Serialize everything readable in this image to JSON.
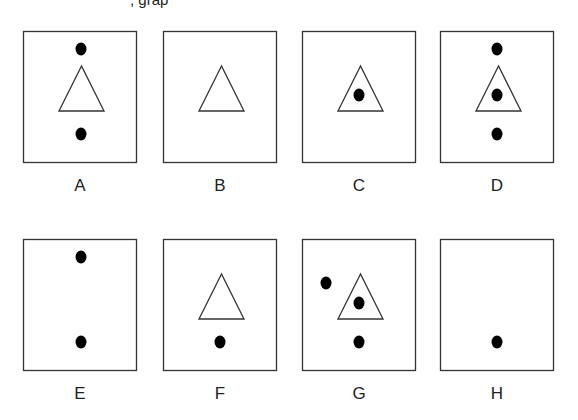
{
  "header": {
    "cut_off_text": ", grap"
  },
  "figure": {
    "stroke_color": "#333333",
    "fill_color": "#000000",
    "box": {
      "width": 113,
      "height": 131
    },
    "panels": [
      {
        "label": "A",
        "x": 23,
        "y": 31,
        "triangle": true,
        "dots": [
          {
            "x": 58,
            "y": 18
          },
          {
            "x": 58,
            "y": 103
          }
        ]
      },
      {
        "label": "B",
        "x": 163,
        "y": 31,
        "triangle": true,
        "dots": []
      },
      {
        "label": "C",
        "x": 302,
        "y": 31,
        "triangle": true,
        "dots": [
          {
            "x": 57,
            "y": 64
          }
        ]
      },
      {
        "label": "D",
        "x": 440,
        "y": 31,
        "triangle": true,
        "dots": [
          {
            "x": 57,
            "y": 18
          },
          {
            "x": 57,
            "y": 64
          },
          {
            "x": 57,
            "y": 103
          }
        ]
      },
      {
        "label": "E",
        "x": 23,
        "y": 239,
        "triangle": false,
        "dots": [
          {
            "x": 58,
            "y": 18
          },
          {
            "x": 58,
            "y": 103
          }
        ]
      },
      {
        "label": "F",
        "x": 163,
        "y": 239,
        "triangle": true,
        "dots": [
          {
            "x": 57,
            "y": 103
          }
        ]
      },
      {
        "label": "G",
        "x": 302,
        "y": 239,
        "triangle": true,
        "dots": [
          {
            "x": 24,
            "y": 44
          },
          {
            "x": 57,
            "y": 64
          },
          {
            "x": 57,
            "y": 103
          }
        ]
      },
      {
        "label": "H",
        "x": 440,
        "y": 239,
        "triangle": false,
        "dots": [
          {
            "x": 57,
            "y": 103
          }
        ]
      }
    ],
    "triangle": {
      "apex_y": 35,
      "base_y": 80,
      "base_left": 36,
      "base_right": 81
    }
  }
}
